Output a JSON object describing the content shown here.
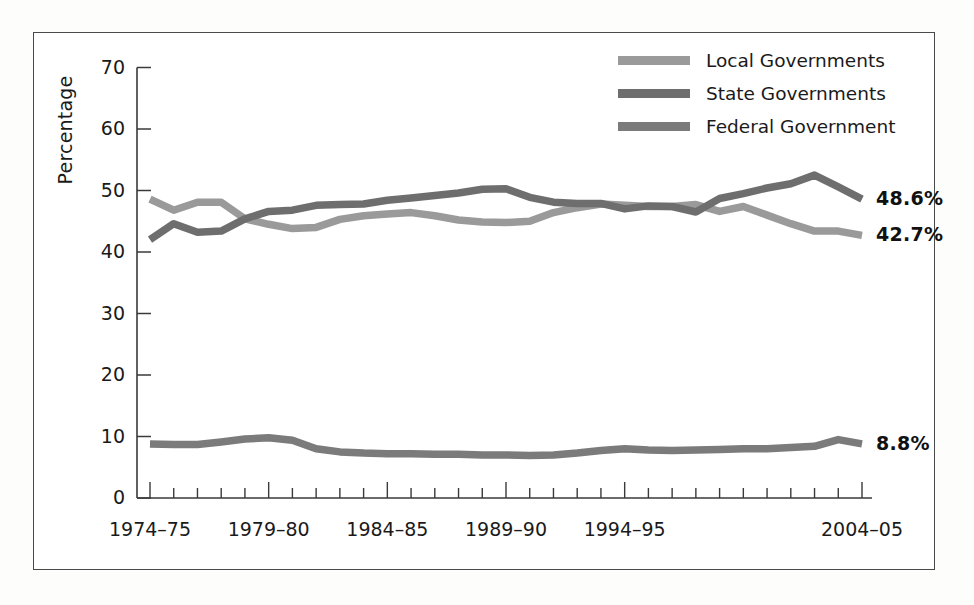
{
  "chart_data": {
    "type": "line",
    "title": "",
    "xlabel": "",
    "ylabel": "Percentage",
    "ylim": [
      0,
      70
    ],
    "yticks": [
      0,
      10,
      20,
      30,
      40,
      50,
      60,
      70
    ],
    "grid": false,
    "legend_position": "top-right",
    "x": [
      "1974-75",
      "1975-76",
      "1976-77",
      "1977-78",
      "1978-79",
      "1979-80",
      "1980-81",
      "1981-82",
      "1982-83",
      "1983-84",
      "1984-85",
      "1985-86",
      "1986-87",
      "1987-88",
      "1988-89",
      "1989-90",
      "1990-91",
      "1991-92",
      "1992-93",
      "1993-94",
      "1994-95",
      "1995-96",
      "1996-97",
      "1997-98",
      "1998-99",
      "1999-00",
      "2000-01",
      "2001-02",
      "2002-03",
      "2003-04",
      "2004-05"
    ],
    "xtick_labels": [
      "1974–75",
      "1979–80",
      "1984–85",
      "1989–90",
      "1994–95",
      "2004–05"
    ],
    "xtick_positions": [
      0,
      5,
      10,
      15,
      20,
      30
    ],
    "series": [
      {
        "name": "Local Governments",
        "color": "#9a9a9a",
        "end_label": "42.7%",
        "values": [
          48.6,
          46.8,
          48.1,
          48.1,
          45.4,
          44.5,
          43.8,
          44.0,
          45.3,
          45.9,
          46.2,
          46.4,
          45.9,
          45.2,
          44.9,
          44.8,
          45.0,
          46.4,
          47.2,
          47.8,
          47.6,
          47.4,
          47.4,
          47.7,
          46.6,
          47.4,
          46.0,
          44.6,
          43.4,
          43.4,
          42.7
        ]
      },
      {
        "name": "State Governments",
        "color": "#6e6e6e",
        "end_label": "48.6%",
        "values": [
          42.0,
          44.6,
          43.2,
          43.4,
          45.4,
          46.6,
          46.8,
          47.6,
          47.7,
          47.8,
          48.4,
          48.8,
          49.2,
          49.6,
          50.2,
          50.3,
          48.9,
          48.1,
          47.9,
          47.9,
          47.0,
          47.5,
          47.4,
          46.5,
          48.7,
          49.5,
          50.4,
          51.1,
          52.5,
          50.6,
          48.6
        ]
      },
      {
        "name": "Federal Government",
        "color": "#7b7b7b",
        "end_label": "8.8%",
        "values": [
          8.8,
          8.7,
          8.7,
          9.1,
          9.6,
          9.8,
          9.4,
          8.0,
          7.5,
          7.3,
          7.2,
          7.2,
          7.1,
          7.1,
          7.0,
          7.0,
          6.9,
          7.0,
          7.3,
          7.7,
          8.0,
          7.8,
          7.7,
          7.8,
          7.9,
          8.0,
          8.0,
          8.2,
          8.4,
          9.5,
          8.8
        ]
      }
    ]
  },
  "legend": {
    "items": [
      {
        "label": "Local Governments"
      },
      {
        "label": "State Governments"
      },
      {
        "label": "Federal Government"
      }
    ]
  },
  "axis": {
    "y_label": "Percentage",
    "y_ticks": [
      "70",
      "60",
      "50",
      "40",
      "30",
      "20",
      "10",
      "0"
    ],
    "x_ticks": [
      "1974–75",
      "1979–80",
      "1984–85",
      "1989–90",
      "1994–95",
      "2004–05"
    ]
  },
  "end_labels": {
    "state": "48.6%",
    "local": "42.7%",
    "federal": "8.8%"
  },
  "colors": {
    "local": "#9a9a9a",
    "state": "#6e6e6e",
    "federal": "#7b7b7b",
    "axis": "#3a3a3a",
    "frame": "#4a4a4a",
    "text": "#1a1a1a"
  }
}
